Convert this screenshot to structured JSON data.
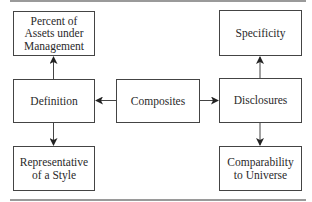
{
  "diagram": {
    "nodes": {
      "composites": {
        "label": "Composites"
      },
      "definition": {
        "label": "Definition"
      },
      "disclosures": {
        "label": "Disclosures"
      },
      "percent_aum": {
        "label": "Percent of\nAssets under\nManagement"
      },
      "representative": {
        "label": "Representative\nof a Style"
      },
      "specificity": {
        "label": "Specificity"
      },
      "comparability": {
        "label": "Comparability\nto Universe"
      }
    },
    "edges": [
      {
        "from": "Composites",
        "to": "Definition"
      },
      {
        "from": "Composites",
        "to": "Disclosures"
      },
      {
        "from": "Definition",
        "to": "Percent of Assets under Management"
      },
      {
        "from": "Definition",
        "to": "Representative of a Style"
      },
      {
        "from": "Disclosures",
        "to": "Specificity"
      },
      {
        "from": "Disclosures",
        "to": "Comparability to Universe"
      }
    ],
    "colors": {
      "line": "#444444",
      "rule": "#9a9a9a",
      "text": "#2a2a2a"
    }
  }
}
